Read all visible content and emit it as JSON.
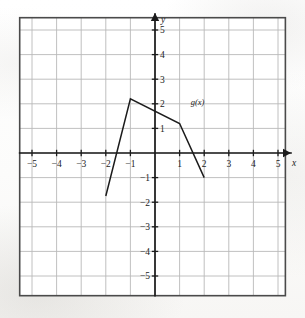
{
  "figure": {
    "title": "",
    "background_color": "#fdfdfc",
    "grid_border_color": "#4a4a4a",
    "grid_line_color": "#b9b9b9",
    "axis_color": "#1b1b1b",
    "curve_color": "#1b1b1b"
  },
  "axes": {
    "x_axis_name": "x",
    "y_axis_name": "y",
    "x_tick_labels": [
      "−5",
      "−4",
      "−3",
      "−2",
      "−1",
      "1",
      "2",
      "3",
      "4",
      "5"
    ],
    "y_tick_labels": [
      "5",
      "4",
      "3",
      "2",
      "1",
      "−1",
      "−2",
      "−3",
      "−4",
      "−5"
    ],
    "x_ticks": [
      -5,
      -4,
      -3,
      -2,
      -1,
      1,
      2,
      3,
      4,
      5
    ],
    "y_ticks": [
      5,
      4,
      3,
      2,
      1,
      -1,
      -2,
      -3,
      -4,
      -5
    ]
  },
  "chart_data": {
    "type": "line",
    "title": "",
    "xlabel": "x",
    "ylabel": "y",
    "xlim": [
      -5.5,
      5.5
    ],
    "ylim": [
      -5.5,
      5.5
    ],
    "grid": true,
    "legend_position": "inline-label",
    "series": [
      {
        "name": "g(x)",
        "label": "g(x)",
        "label_x": 1.45,
        "label_y": 1.95,
        "points": [
          {
            "x": -2.0,
            "y": -1.75
          },
          {
            "x": -1.0,
            "y": 2.2
          },
          {
            "x": 1.0,
            "y": 1.2
          },
          {
            "x": 2.0,
            "y": -1.0
          }
        ]
      }
    ]
  }
}
